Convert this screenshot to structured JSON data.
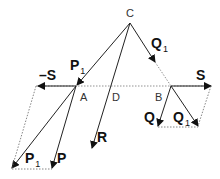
{
  "diagram": {
    "points": {
      "C": {
        "label": "C",
        "x": 130,
        "y": 23
      },
      "A": {
        "label": "A",
        "x": 76,
        "y": 86
      },
      "D": {
        "label": "D",
        "x": 111,
        "y": 86
      },
      "B": {
        "label": "B",
        "x": 171,
        "y": 86
      }
    },
    "vectors": {
      "S": {
        "label": "S",
        "sub": ""
      },
      "minus_S": {
        "label": "–S",
        "sub": ""
      },
      "P1_top": {
        "label": "P",
        "sub": "1"
      },
      "P1_bottom": {
        "label": "P",
        "sub": "1"
      },
      "P": {
        "label": "P",
        "sub": ""
      },
      "Q1_top": {
        "label": "Q",
        "sub": "1"
      },
      "Q1_bottom": {
        "label": "Q",
        "sub": "1"
      },
      "Q": {
        "label": "Q",
        "sub": ""
      },
      "R": {
        "label": "R",
        "sub": ""
      }
    },
    "colors": {
      "line": "#222222",
      "dashed": "#555555"
    }
  }
}
